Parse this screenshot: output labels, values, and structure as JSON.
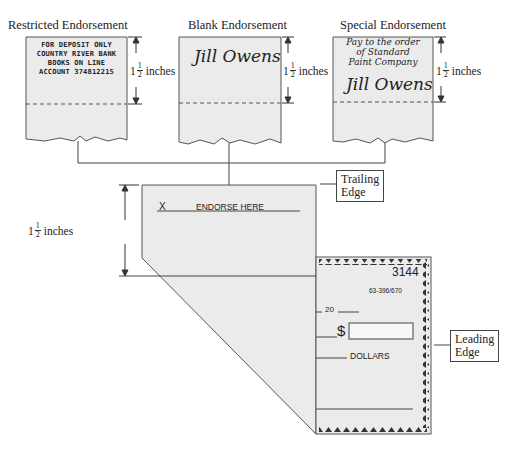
{
  "panels": [
    {
      "title": "Restricted Endorsement",
      "lines": [
        "FOR DEPOSIT ONLY",
        "COUNTRY RIVER BANK",
        "BOOKS ON LINE",
        "ACCOUNT 374812215"
      ],
      "dimension": {
        "whole": "1",
        "num": "1",
        "den": "2",
        "unit": "inches"
      }
    },
    {
      "title": "Blank Endorsement",
      "signature": "Jill Owens",
      "dimension": {
        "whole": "1",
        "num": "1",
        "den": "2",
        "unit": "inches"
      }
    },
    {
      "title": "Special Endorsement",
      "lines": [
        "Pay to the order",
        "of Standard",
        "Paint Company"
      ],
      "signature": "Jill Owens",
      "dimension": {
        "whole": "1",
        "num": "1",
        "den": "2",
        "unit": "inches"
      }
    }
  ],
  "check": {
    "endorse_x": "X",
    "endorse_label": "ENDORSE HERE",
    "dimension": {
      "whole": "1",
      "num": "1",
      "den": "2",
      "unit": "inches"
    },
    "number": "3144",
    "routing": "63-396/670",
    "date_prefix": "20",
    "dollar_sign": "$",
    "dollars_label": "DOLLARS"
  },
  "callouts": {
    "trailing": [
      "Trailing",
      "Edge"
    ],
    "leading": [
      "Leading",
      "Edge"
    ]
  },
  "colors": {
    "paper": "#ebebeb",
    "line": "#444444"
  }
}
